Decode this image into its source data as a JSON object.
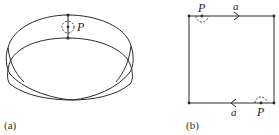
{
  "figure": {
    "panels": [
      {
        "id": "a",
        "caption": "(a)",
        "description": "Möbius band drawn as a twisted elliptical strip",
        "point_label": "P"
      },
      {
        "id": "b",
        "caption": "(b)",
        "description": "Square identification diagram of the Möbius band",
        "point_label_top": "P",
        "point_label_bottom": "P",
        "edge_label_top": "a",
        "edge_label_bottom": "a"
      }
    ],
    "colors": {
      "stroke": "#2a2a2a",
      "background": "#ffffff"
    }
  }
}
